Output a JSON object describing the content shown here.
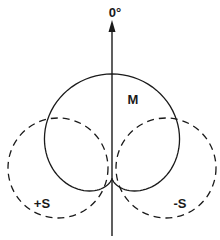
{
  "diagram": {
    "type": "polar-pickup-pattern",
    "axis_label": "0°",
    "labels": {
      "mid": "M",
      "side_plus": "+S",
      "side_minus": "-S"
    },
    "patterns": [
      {
        "name": "M",
        "shape": "cardioid",
        "line_style": "solid",
        "orientation_deg": 0
      },
      {
        "name": "+S",
        "shape": "circle-lobe",
        "line_style": "dashed",
        "side": "left"
      },
      {
        "name": "-S",
        "shape": "circle-lobe",
        "line_style": "dashed",
        "side": "right"
      }
    ],
    "colors": {
      "stroke": "#1a1a1a",
      "background": "#ffffff"
    }
  }
}
